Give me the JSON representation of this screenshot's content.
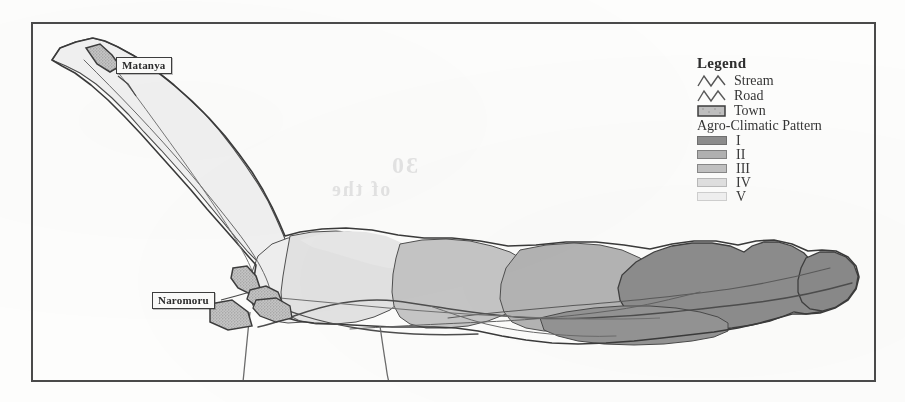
{
  "figure": {
    "kind": "thematic-map",
    "region": "Naro Moru catchment, Kenya",
    "frame": {
      "x": 31,
      "y": 22,
      "width": 845,
      "height": 360
    }
  },
  "legend": {
    "title": "Legend",
    "symbol_items": [
      {
        "label": "Stream",
        "symbol": "zigzag-line-icon",
        "color": "#555555"
      },
      {
        "label": "Road",
        "symbol": "zigzag-line-icon",
        "color": "#555555"
      },
      {
        "label": "Town",
        "symbol": "filled-box-icon",
        "color": "#b8b8b8"
      }
    ],
    "section_title": "Agro-Climatic Pattern",
    "classes": [
      {
        "label": "I",
        "color": "#8d8d8d"
      },
      {
        "label": "II",
        "color": "#b2b2b2"
      },
      {
        "label": "III",
        "color": "#c2c2c2"
      },
      {
        "label": "IV",
        "color": "#e0e0e0"
      },
      {
        "label": "V",
        "color": "#f1f1f1"
      }
    ]
  },
  "towns": [
    {
      "name": "Matanya",
      "label_x": 116,
      "label_y": 57
    },
    {
      "name": "Naromoru",
      "label_x": 152,
      "label_y": 292
    }
  ],
  "bleed_through": [
    {
      "text": "2003",
      "x": 205,
      "y": 200,
      "size": 26
    },
    {
      "text": "figure",
      "x": 300,
      "y": 255,
      "size": 22
    },
    {
      "text": "30",
      "x": 390,
      "y": 165,
      "size": 24
    },
    {
      "text": "of the",
      "x": 330,
      "y": 190,
      "size": 20
    }
  ]
}
